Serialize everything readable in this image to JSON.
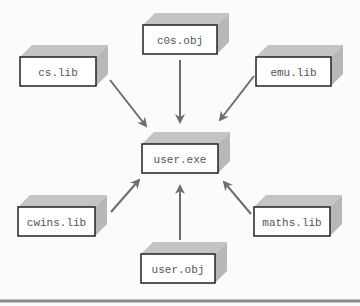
{
  "diagram": {
    "center": {
      "id": "user_exe",
      "label": "user.exe",
      "x": 142,
      "y": 144,
      "w": 76,
      "h": 29
    },
    "nodes": [
      {
        "id": "c0s_obj",
        "label": "c0s.obj",
        "x": 143,
        "y": 25,
        "w": 74,
        "h": 29
      },
      {
        "id": "cs_lib",
        "label": "cs.lib",
        "x": 20,
        "y": 57,
        "w": 76,
        "h": 29
      },
      {
        "id": "emu_lib",
        "label": "emu.lib",
        "x": 256,
        "y": 57,
        "w": 75,
        "h": 29
      },
      {
        "id": "cwins_lib",
        "label": "cwins.lib",
        "x": 18,
        "y": 207,
        "w": 77,
        "h": 29
      },
      {
        "id": "maths_lib",
        "label": "maths.lib",
        "x": 254,
        "y": 207,
        "w": 76,
        "h": 29
      },
      {
        "id": "user_obj",
        "label": "user.obj",
        "x": 141,
        "y": 254,
        "w": 74,
        "h": 29
      }
    ],
    "edges": [
      {
        "from": "c0s_obj",
        "to": "user_exe"
      },
      {
        "from": "cs_lib",
        "to": "user_exe"
      },
      {
        "from": "emu_lib",
        "to": "user_exe"
      },
      {
        "from": "cwins_lib",
        "to": "user_exe"
      },
      {
        "from": "maths_lib",
        "to": "user_exe"
      },
      {
        "from": "user_obj",
        "to": "user_exe"
      }
    ],
    "colors": {
      "box_border": "#222222",
      "box_fill": "#ffffff",
      "shadow": "#b8b8b8",
      "arrow": "#6e6e6e",
      "rule": "#8a8a8a",
      "text": "#555555"
    }
  }
}
